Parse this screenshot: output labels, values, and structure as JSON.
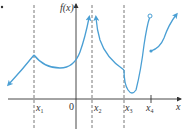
{
  "figure": {
    "y_axis_label": "f(x)",
    "x_axis_label": "x",
    "origin_label": "0",
    "tick_labels": [
      {
        "base": "x",
        "sub": "1"
      },
      {
        "base": "x",
        "sub": "2"
      },
      {
        "base": "x",
        "sub": "3"
      },
      {
        "base": "x",
        "sub": "4"
      }
    ],
    "colors": {
      "curve": "#4a9fd4",
      "axis": "#333333",
      "dashed": "#555555"
    },
    "features": {
      "cusp_at": "x1",
      "vertical_asymptote_at": "x2",
      "corner_at": "x3",
      "jump_discontinuity_at": "x4",
      "open_circle_at": "x4 (left piece endpoint)",
      "closed_dot_at": "x4 (right piece start)"
    }
  }
}
